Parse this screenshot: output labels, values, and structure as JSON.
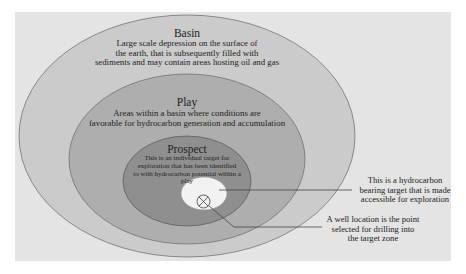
{
  "diagram": {
    "basin": {
      "title": "Basin",
      "lines": [
        "Large scale depression on the surface of",
        "the earth, that is subsequently filled with",
        "sediments and may contain areas hosting oil and gas"
      ]
    },
    "play": {
      "title": "Play",
      "lines": [
        "Areas within a basin where conditions are",
        "favorable for hydrocarbon generation and accumulation"
      ]
    },
    "prospect": {
      "title": "Prospect",
      "lines": [
        "This is an individual target for",
        "exploration that has been identified",
        "to with hydrocarbon potential within a play"
      ]
    },
    "target_callout": {
      "lines": [
        "This is a hydrocarbon",
        "bearing target that is made",
        "accessible for exploration"
      ]
    },
    "well_callout": {
      "lines": [
        "A well location is the point",
        "selected for drilling into",
        "the target zone"
      ]
    },
    "icons": {
      "well_symbol": "circle-with-x"
    },
    "colors": {
      "background": "#e4e4e4",
      "basin": "#cbcbcb",
      "play": "#aeaeae",
      "prospect": "#8f8f8f",
      "target": "#f2f2f2",
      "stroke": "#555555"
    }
  }
}
